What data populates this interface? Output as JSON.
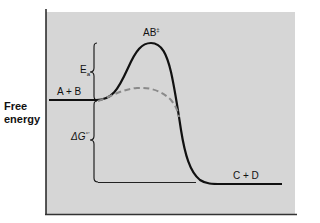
{
  "diagram": {
    "type": "reaction-energy-profile",
    "y_axis_label_line1": "Free",
    "y_axis_label_line2": "energy",
    "reactants_label": "A + B",
    "products_label": "C + D",
    "transition_state_label": "AB",
    "transition_state_superscript": "‡",
    "activation_energy_label": "E",
    "activation_energy_subscript": "a",
    "free_energy_change_label": "ΔG",
    "free_energy_change_superscript": "°′",
    "curves": [
      {
        "name": "uncatalyzed",
        "style": "solid",
        "color": "#111111"
      },
      {
        "name": "catalyzed",
        "style": "dashed",
        "color": "#8a8a8a"
      }
    ],
    "colors": {
      "panel_background": "#d6d6d6",
      "line": "#111111",
      "dashed": "#8a8a8a"
    }
  }
}
